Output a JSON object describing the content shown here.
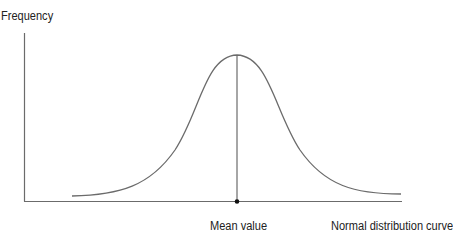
{
  "diagram": {
    "y_axis_label": "Frequency",
    "mean_label": "Mean value",
    "curve_label": "Normal distribution curve",
    "colors": {
      "axis": "#6b6b6b",
      "curve": "#6b6b6b",
      "mean_line": "#6b6b6b",
      "mean_dot": "#111111",
      "text": "#222222"
    }
  }
}
